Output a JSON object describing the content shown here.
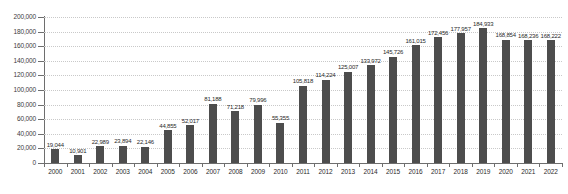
{
  "chart_data": {
    "type": "bar",
    "title": "",
    "subtitle": "",
    "xlabel": "",
    "ylabel": "",
    "ylim": [
      0,
      200000
    ],
    "ytick_step": 20000,
    "grid": true,
    "legend": "none",
    "bar_color": "#4d4d4d",
    "gridline_color": "#c9c9c9",
    "axis_color": "#6e6e6e",
    "categories": [
      "2000",
      "2001",
      "2002",
      "2003",
      "2004",
      "2005",
      "2006",
      "2007",
      "2008",
      "2009",
      "2010",
      "2011",
      "2012",
      "2013",
      "2014",
      "2015",
      "2016",
      "2017",
      "2018",
      "2019",
      "2020",
      "2021",
      "2022"
    ],
    "values": [
      19044,
      10901,
      22989,
      23894,
      22146,
      44855,
      52017,
      81188,
      71218,
      79996,
      55355,
      105818,
      114224,
      125007,
      133972,
      145726,
      161015,
      172456,
      177957,
      184933,
      168854,
      168236,
      168222
    ],
    "value_labels": [
      "19,044",
      "10,901",
      "22,989",
      "23,894",
      "22,146",
      "44,855",
      "52,017",
      "81,188",
      "71,218",
      "79,996",
      "55,355",
      "105,818",
      "114,224",
      "125,007",
      "133,972",
      "145,726",
      "161,015",
      "172,456",
      "177,957",
      "184,933",
      "168,854",
      "168,236",
      "168,222"
    ],
    "ytick_labels": [
      "200,000",
      "180,000",
      "160,000",
      "140,000",
      "120,000",
      "100,000",
      "80,000",
      "60,000",
      "40,000",
      "20,000",
      "0"
    ],
    "ytick_values": [
      200000,
      180000,
      160000,
      140000,
      120000,
      100000,
      80000,
      60000,
      40000,
      20000,
      0
    ]
  }
}
